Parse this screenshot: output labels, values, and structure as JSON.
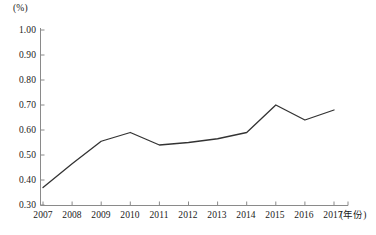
{
  "chart_data": {
    "type": "line",
    "title": "",
    "subtitle": "",
    "xlabel": "(年份)",
    "ylabel": "(%)",
    "unit_label": "(%)",
    "categories": [
      "2007",
      "2008",
      "2009",
      "2010",
      "2011",
      "2012",
      "2013",
      "2014",
      "2015",
      "2016",
      "2017"
    ],
    "x": [
      2007,
      2008,
      2009,
      2010,
      2011,
      2012,
      2013,
      2014,
      2015,
      2016,
      2017
    ],
    "values": [
      0.37,
      0.465,
      0.555,
      0.59,
      0.54,
      0.55,
      0.565,
      0.59,
      0.7,
      0.64,
      0.68
    ],
    "series": [
      {
        "name": "",
        "values": [
          0.37,
          0.465,
          0.555,
          0.59,
          0.54,
          0.55,
          0.565,
          0.59,
          0.7,
          0.64,
          0.68
        ]
      }
    ],
    "ylim": [
      0.3,
      1.0
    ],
    "ytick_labels": [
      "1.00",
      "0.90",
      "0.80",
      "0.70",
      "0.60",
      "0.50",
      "0.40",
      "0.30"
    ],
    "yticks": [
      1.0,
      0.9,
      0.8,
      0.7,
      0.6,
      0.5,
      0.4,
      0.3
    ],
    "grid": false,
    "legend": false,
    "legend_position": "none",
    "line_color": "#333333",
    "axis_color": "#8a8a8a",
    "markers": false
  }
}
